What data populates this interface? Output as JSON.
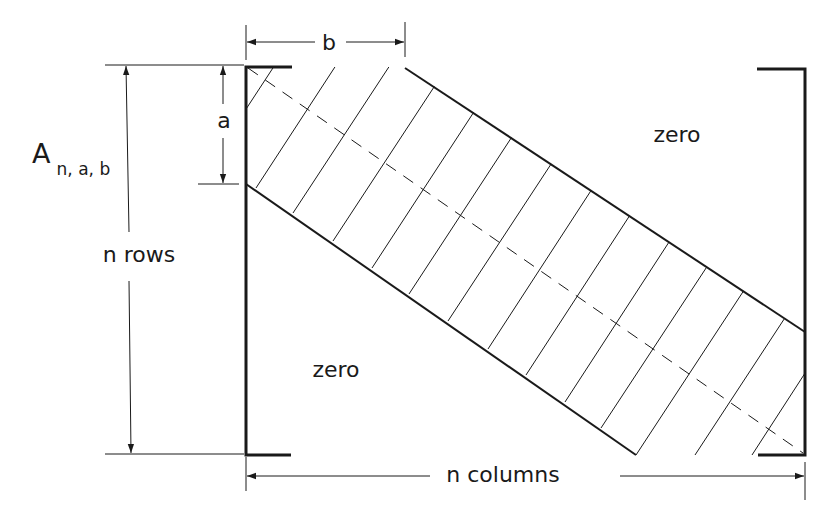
{
  "diagram": {
    "matrix_label": {
      "main": "A",
      "subscript": "n, a, b"
    },
    "labels": {
      "upper_zero": "zero",
      "lower_zero": "zero",
      "rows": "n rows",
      "columns": "n columns",
      "a": "a",
      "b": "b"
    },
    "colors": {
      "ink": "#1a1a1a",
      "background": "#ffffff"
    },
    "geometry": {
      "matrix_left_x": 246,
      "matrix_right_x": 805,
      "matrix_top_y": 67,
      "matrix_bottom_y": 455,
      "band_upper_edge": [
        [
          405,
          67
        ],
        [
          805,
          332
        ]
      ],
      "band_lower_edge": [
        [
          246,
          184
        ],
        [
          636,
          455
        ]
      ],
      "main_diagonal": [
        [
          246,
          67
        ],
        [
          805,
          455
        ]
      ]
    }
  }
}
